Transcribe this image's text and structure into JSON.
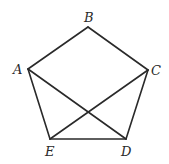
{
  "diagram": {
    "type": "pentagon-with-diagonals",
    "vertices": [
      {
        "name": "A",
        "x": 28,
        "y": 69,
        "label_x": 13,
        "label_y": 74
      },
      {
        "name": "B",
        "x": 88,
        "y": 27,
        "label_x": 84,
        "label_y": 22
      },
      {
        "name": "C",
        "x": 148,
        "y": 70,
        "label_x": 151,
        "label_y": 75
      },
      {
        "name": "D",
        "x": 126,
        "y": 139,
        "label_x": 121,
        "label_y": 156
      },
      {
        "name": "E",
        "x": 50,
        "y": 139,
        "label_x": 45,
        "label_y": 156
      }
    ],
    "edges": [
      [
        "A",
        "B"
      ],
      [
        "B",
        "C"
      ],
      [
        "C",
        "D"
      ],
      [
        "D",
        "E"
      ],
      [
        "E",
        "A"
      ],
      [
        "A",
        "D"
      ],
      [
        "C",
        "E"
      ]
    ],
    "labels": {
      "A": "A",
      "B": "B",
      "C": "C",
      "D": "D",
      "E": "E"
    },
    "colors": {
      "stroke": "#2a2a2a",
      "background": "#ffffff"
    }
  }
}
